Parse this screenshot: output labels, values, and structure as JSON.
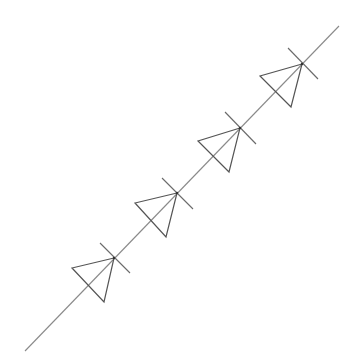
{
  "diagram": {
    "type": "circuit-schematic",
    "colors": {
      "background": "#ffffff",
      "wire": "#8a8a8a",
      "symbol": "#555555"
    },
    "wire": {
      "x1": 25,
      "y1": 351,
      "x2": 339,
      "y2": 26
    },
    "diodes": [
      {
        "cathode": [
          114,
          258
        ],
        "corner_a": [
          72,
          268
        ],
        "corner_b": [
          104,
          302
        ],
        "bar_start": [
          100,
          243
        ],
        "bar_end": [
          130,
          273
        ]
      },
      {
        "cathode": [
          177,
          193
        ],
        "corner_a": [
          135,
          203
        ],
        "corner_b": [
          166,
          237
        ],
        "bar_start": [
          162,
          178
        ],
        "bar_end": [
          193,
          209
        ]
      },
      {
        "cathode": [
          240,
          128
        ],
        "corner_a": [
          198,
          141
        ],
        "corner_b": [
          229,
          172
        ],
        "bar_start": [
          225,
          112
        ],
        "bar_end": [
          256,
          144
        ]
      },
      {
        "cathode": [
          302,
          64
        ],
        "corner_a": [
          260,
          76
        ],
        "corner_b": [
          291,
          107
        ],
        "bar_start": [
          288,
          48
        ],
        "bar_end": [
          318,
          79
        ]
      }
    ]
  }
}
